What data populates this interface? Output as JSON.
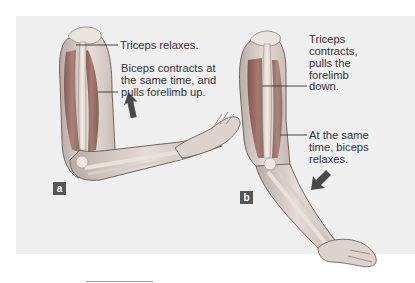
{
  "diagram": {
    "type": "anatomical illustration",
    "colors": {
      "background_panel": "#efefef",
      "muscle": "#9c6d64",
      "bone": "#e4dfd6",
      "skin": "#dcd2cc",
      "badge": "#555555",
      "text": "#333333"
    },
    "panels": [
      {
        "badge": "a",
        "arrow": "up",
        "labels": {
          "triceps": "Triceps relaxes.",
          "biceps_line1": "Biceps contracts at",
          "biceps_line2": "the same time, and",
          "biceps_line3": "pulls forelimb up."
        }
      },
      {
        "badge": "b",
        "arrow": "down-left",
        "labels": {
          "triceps_line1": "Triceps",
          "triceps_line2": "contracts,",
          "triceps_line3": "pulls the",
          "triceps_line4": "forelimb",
          "triceps_line5": "down.",
          "biceps_line1": "At the same",
          "biceps_line2": "time, biceps",
          "biceps_line3": "relaxes."
        }
      }
    ]
  }
}
